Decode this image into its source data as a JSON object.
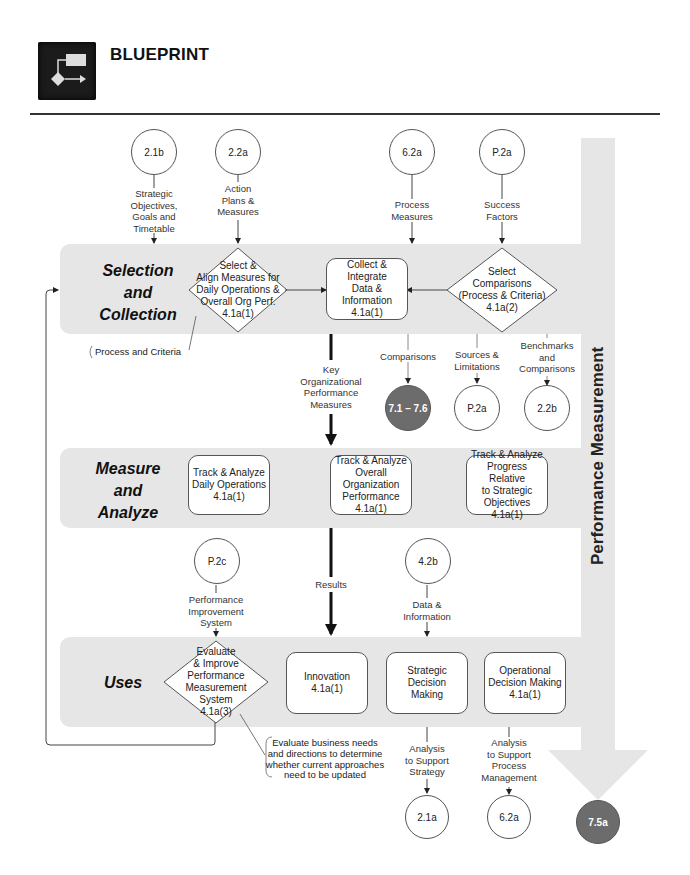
{
  "header": {
    "title": "BLUEPRINT",
    "logo_icon": "flowchart-icon"
  },
  "side_bar": {
    "label": "Performance Measurement",
    "end_circle": "7.5a",
    "colors": {
      "band": "#e6e6e6",
      "dark_circle": "#6c6c6c"
    }
  },
  "bands": {
    "selection": {
      "label_line1": "Selection",
      "label_line2": "and",
      "label_line3": "Collection"
    },
    "measure": {
      "label_line1": "Measure",
      "label_line2": "and",
      "label_line3": "Analyze"
    },
    "uses": {
      "label": "Uses"
    }
  },
  "top_inputs": [
    {
      "ref": "2.1b",
      "label": [
        "Strategic",
        "Objectives,",
        "Goals and",
        "Timetable"
      ]
    },
    {
      "ref": "2.2a",
      "label": [
        "Action",
        "Plans &",
        "Measures"
      ]
    },
    {
      "ref": "6.2a",
      "label": [
        "Process",
        "Measures"
      ]
    },
    {
      "ref": "P.2a",
      "label": [
        "Success",
        "Factors"
      ]
    }
  ],
  "selection_nodes": {
    "select_align": [
      "Select &",
      "Align Measures for",
      "Daily Operations &",
      "Overall Org Perf.",
      "4.1a(1)"
    ],
    "collect": [
      "Collect & Integrate",
      "Data &",
      "Information",
      "4.1a(1)"
    ],
    "select_comparisons": [
      "Select",
      "Comparisons",
      "(Process & Criteria)",
      "4.1a(2)"
    ]
  },
  "callouts": {
    "process_criteria": "Process and Criteria",
    "evaluate_needs": [
      "Evaluate business needs",
      "and directions to determine",
      "whether current approaches",
      "need to be updated"
    ]
  },
  "selection_outputs": [
    {
      "label": [
        "Comparisons"
      ],
      "ref": "7.1 – 7.6",
      "dark": true
    },
    {
      "label": [
        "Sources &",
        "Limitations"
      ],
      "ref": "P.2a",
      "dark": false
    },
    {
      "label": [
        "Benchmarks",
        "and",
        "Comparisons"
      ],
      "ref": "2.2b",
      "dark": false
    }
  ],
  "key_measures_label": [
    "Key",
    "Organizational",
    "Performance",
    "Measures"
  ],
  "measure_nodes": [
    [
      "Track & Analyze",
      "Daily Operations",
      "4.1a(1)"
    ],
    [
      "Track & Analyze",
      "Overall",
      "Organization",
      "Performance",
      "4.1a(1)"
    ],
    [
      "Track & Analyze",
      "Progress Relative",
      "to Strategic",
      "Objectives",
      "4.1a(1)"
    ]
  ],
  "mid_inputs": [
    {
      "ref": "P.2c",
      "label": [
        "Performance",
        "Improvement",
        "System"
      ]
    },
    {
      "ref": "4.2b",
      "label": [
        "Data &",
        "Information"
      ]
    }
  ],
  "results_label": "Results",
  "uses_nodes": {
    "evaluate": [
      "Evaluate",
      "& Improve",
      "Performance",
      "Measurement",
      "System",
      "4.1a(3)"
    ],
    "innovation": [
      "Innovation",
      "4.1a(1)"
    ],
    "strategic": [
      "Strategic Decision",
      "Making"
    ],
    "operational": [
      "Operational",
      "Decision Making",
      "4.1a(1)"
    ]
  },
  "uses_outputs": [
    {
      "label": [
        "Analysis",
        "to Support",
        "Strategy"
      ],
      "ref": "2.1a"
    },
    {
      "label": [
        "Analysis",
        "to Support",
        "Process",
        "Management"
      ],
      "ref": "6.2a"
    }
  ]
}
